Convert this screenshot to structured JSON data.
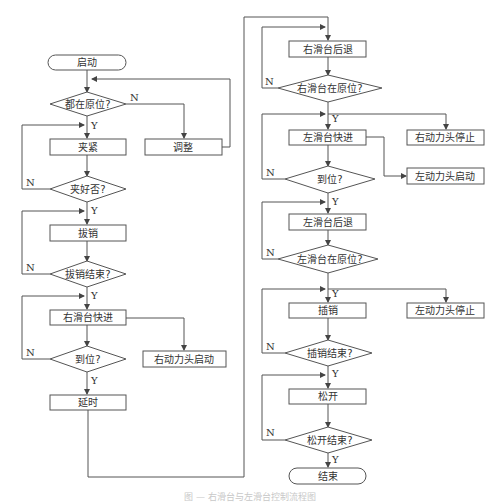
{
  "diagram": {
    "type": "flowchart",
    "caption": "图 — 右滑台与左滑台控制流程图",
    "labels": {
      "yes": "Y",
      "no": "N"
    },
    "left_column": {
      "start": "启动",
      "check_home": "都在原位?",
      "clamp": "夹紧",
      "adjust": "调整",
      "check_clamped": "夹好否?",
      "pull_pin": "拔销",
      "check_pull_done": "拔销结束?",
      "right_slide_fast": "右滑台快进",
      "check_in_place": "到位?",
      "right_head_start": "右动力头启动",
      "delay": "延时"
    },
    "right_column": {
      "right_slide_back": "右滑台后退",
      "check_right_home": "右滑台在原位?",
      "left_slide_fast": "左滑台快进",
      "right_head_stop": "右动力头停止",
      "check_in_place": "到位?",
      "left_head_start": "左动力头启动",
      "left_slide_back": "左滑台后退",
      "check_left_home": "左滑台在原位?",
      "insert_pin": "插销",
      "left_head_stop": "左动力头停止",
      "check_insert_done": "插销结束?",
      "release": "松开",
      "check_release_done": "松开结束?",
      "end": "结束"
    }
  }
}
